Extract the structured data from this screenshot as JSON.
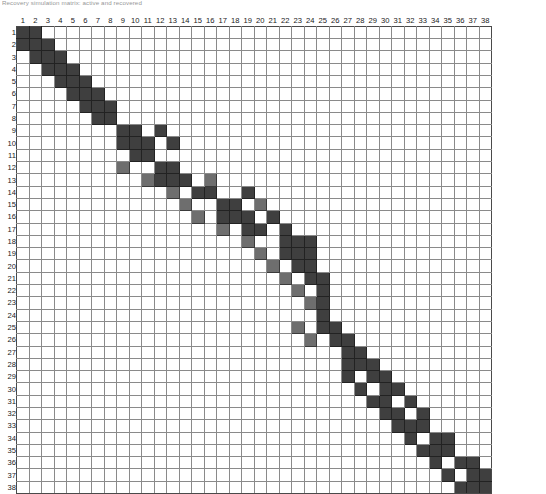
{
  "page": {
    "title": "Recovery simulation matrix: active and recovered",
    "grid_label_axis_top": "column index",
    "grid_label_axis_left": "row index"
  },
  "legend": {
    "on_color": "#3f3f3f",
    "mid_color": "#6e6e6e",
    "off_color": "#ffffff",
    "line_color": "#8a8a8a"
  },
  "chart_data": {
    "type": "heatmap",
    "title": "Recovery simulation matrix: active and recovered",
    "xlabel": "",
    "ylabel": "",
    "grid": true,
    "legend_position": "none",
    "columns": [
      1,
      2,
      3,
      4,
      5,
      6,
      7,
      8,
      9,
      10,
      11,
      12,
      13,
      14,
      15,
      16,
      17,
      18,
      19,
      20,
      21,
      22,
      23,
      24,
      25,
      26,
      27,
      28,
      29,
      30,
      31,
      32,
      33,
      34,
      35,
      36,
      37,
      38
    ],
    "rows": [
      1,
      2,
      3,
      4,
      5,
      6,
      7,
      8,
      9,
      10,
      11,
      12,
      13,
      14,
      15,
      16,
      17,
      18,
      19,
      20,
      21,
      22,
      23,
      24,
      25,
      26,
      27,
      28,
      29,
      30,
      31,
      32,
      33,
      34,
      35,
      36,
      37,
      38
    ],
    "value_levels": {
      "0": "empty",
      "1": "partial",
      "2": "filled"
    },
    "values": [
      [
        2,
        2,
        0,
        0,
        0,
        0,
        0,
        0,
        0,
        0,
        0,
        0,
        0,
        0,
        0,
        0,
        0,
        0,
        0,
        0,
        0,
        0,
        0,
        0,
        0,
        0,
        0,
        0,
        0,
        0,
        0,
        0,
        0,
        0,
        0,
        0,
        0,
        0
      ],
      [
        2,
        2,
        2,
        0,
        0,
        0,
        0,
        0,
        0,
        0,
        0,
        0,
        0,
        0,
        0,
        0,
        0,
        0,
        0,
        0,
        0,
        0,
        0,
        0,
        0,
        0,
        0,
        0,
        0,
        0,
        0,
        0,
        0,
        0,
        0,
        0,
        0,
        0
      ],
      [
        0,
        2,
        2,
        2,
        0,
        0,
        0,
        0,
        0,
        0,
        0,
        0,
        0,
        0,
        0,
        0,
        0,
        0,
        0,
        0,
        0,
        0,
        0,
        0,
        0,
        0,
        0,
        0,
        0,
        0,
        0,
        0,
        0,
        0,
        0,
        0,
        0,
        0
      ],
      [
        0,
        0,
        2,
        2,
        2,
        0,
        0,
        0,
        0,
        0,
        0,
        0,
        0,
        0,
        0,
        0,
        0,
        0,
        0,
        0,
        0,
        0,
        0,
        0,
        0,
        0,
        0,
        0,
        0,
        0,
        0,
        0,
        0,
        0,
        0,
        0,
        0,
        0
      ],
      [
        0,
        0,
        0,
        2,
        2,
        2,
        0,
        0,
        0,
        0,
        0,
        0,
        0,
        0,
        0,
        0,
        0,
        0,
        0,
        0,
        0,
        0,
        0,
        0,
        0,
        0,
        0,
        0,
        0,
        0,
        0,
        0,
        0,
        0,
        0,
        0,
        0,
        0
      ],
      [
        0,
        0,
        0,
        0,
        2,
        2,
        2,
        0,
        0,
        0,
        0,
        0,
        0,
        0,
        0,
        0,
        0,
        0,
        0,
        0,
        0,
        0,
        0,
        0,
        0,
        0,
        0,
        0,
        0,
        0,
        0,
        0,
        0,
        0,
        0,
        0,
        0,
        0
      ],
      [
        0,
        0,
        0,
        0,
        0,
        2,
        2,
        2,
        0,
        0,
        0,
        0,
        0,
        0,
        0,
        0,
        0,
        0,
        0,
        0,
        0,
        0,
        0,
        0,
        0,
        0,
        0,
        0,
        0,
        0,
        0,
        0,
        0,
        0,
        0,
        0,
        0,
        0
      ],
      [
        0,
        0,
        0,
        0,
        0,
        0,
        2,
        2,
        0,
        0,
        0,
        0,
        0,
        0,
        0,
        0,
        0,
        0,
        0,
        0,
        0,
        0,
        0,
        0,
        0,
        0,
        0,
        0,
        0,
        0,
        0,
        0,
        0,
        0,
        0,
        0,
        0,
        0
      ],
      [
        0,
        0,
        0,
        0,
        0,
        0,
        0,
        0,
        2,
        2,
        0,
        2,
        0,
        0,
        0,
        0,
        0,
        0,
        0,
        0,
        0,
        0,
        0,
        0,
        0,
        0,
        0,
        0,
        0,
        0,
        0,
        0,
        0,
        0,
        0,
        0,
        0,
        0
      ],
      [
        0,
        0,
        0,
        0,
        0,
        0,
        0,
        0,
        2,
        2,
        2,
        0,
        2,
        0,
        0,
        0,
        0,
        0,
        0,
        0,
        0,
        0,
        0,
        0,
        0,
        0,
        0,
        0,
        0,
        0,
        0,
        0,
        0,
        0,
        0,
        0,
        0,
        0
      ],
      [
        0,
        0,
        0,
        0,
        0,
        0,
        0,
        0,
        0,
        2,
        2,
        0,
        0,
        0,
        0,
        0,
        0,
        0,
        0,
        0,
        0,
        0,
        0,
        0,
        0,
        0,
        0,
        0,
        0,
        0,
        0,
        0,
        0,
        0,
        0,
        0,
        0,
        0
      ],
      [
        0,
        0,
        0,
        0,
        0,
        0,
        0,
        0,
        1,
        0,
        0,
        2,
        2,
        0,
        0,
        0,
        0,
        0,
        0,
        0,
        0,
        0,
        0,
        0,
        0,
        0,
        0,
        0,
        0,
        0,
        0,
        0,
        0,
        0,
        0,
        0,
        0,
        0
      ],
      [
        0,
        0,
        0,
        0,
        0,
        0,
        0,
        0,
        0,
        0,
        1,
        2,
        2,
        2,
        0,
        1,
        0,
        0,
        0,
        0,
        0,
        0,
        0,
        0,
        0,
        0,
        0,
        0,
        0,
        0,
        0,
        0,
        0,
        0,
        0,
        0,
        0,
        0
      ],
      [
        0,
        0,
        0,
        0,
        0,
        0,
        0,
        0,
        0,
        0,
        0,
        0,
        1,
        0,
        2,
        2,
        0,
        0,
        2,
        0,
        0,
        0,
        0,
        0,
        0,
        0,
        0,
        0,
        0,
        0,
        0,
        0,
        0,
        0,
        0,
        0,
        0,
        0
      ],
      [
        0,
        0,
        0,
        0,
        0,
        0,
        0,
        0,
        0,
        0,
        0,
        0,
        0,
        1,
        0,
        0,
        2,
        2,
        0,
        1,
        0,
        0,
        0,
        0,
        0,
        0,
        0,
        0,
        0,
        0,
        0,
        0,
        0,
        0,
        0,
        0,
        0,
        0
      ],
      [
        0,
        0,
        0,
        0,
        0,
        0,
        0,
        0,
        0,
        0,
        0,
        0,
        0,
        0,
        1,
        0,
        2,
        2,
        2,
        0,
        2,
        0,
        0,
        0,
        0,
        0,
        0,
        0,
        0,
        0,
        0,
        0,
        0,
        0,
        0,
        0,
        0,
        0
      ],
      [
        0,
        0,
        0,
        0,
        0,
        0,
        0,
        0,
        0,
        0,
        0,
        0,
        0,
        0,
        0,
        0,
        1,
        0,
        2,
        2,
        0,
        2,
        0,
        0,
        0,
        0,
        0,
        0,
        0,
        0,
        0,
        0,
        0,
        0,
        0,
        0,
        0,
        0
      ],
      [
        0,
        0,
        0,
        0,
        0,
        0,
        0,
        0,
        0,
        0,
        0,
        0,
        0,
        0,
        0,
        0,
        0,
        0,
        1,
        0,
        0,
        2,
        2,
        2,
        0,
        0,
        0,
        0,
        0,
        0,
        0,
        0,
        0,
        0,
        0,
        0,
        0,
        0
      ],
      [
        0,
        0,
        0,
        0,
        0,
        0,
        0,
        0,
        0,
        0,
        0,
        0,
        0,
        0,
        0,
        0,
        0,
        0,
        0,
        1,
        0,
        2,
        2,
        2,
        0,
        0,
        0,
        0,
        0,
        0,
        0,
        0,
        0,
        0,
        0,
        0,
        0,
        0
      ],
      [
        0,
        0,
        0,
        0,
        0,
        0,
        0,
        0,
        0,
        0,
        0,
        0,
        0,
        0,
        0,
        0,
        0,
        0,
        0,
        0,
        1,
        0,
        2,
        2,
        0,
        0,
        0,
        0,
        0,
        0,
        0,
        0,
        0,
        0,
        0,
        0,
        0,
        0
      ],
      [
        0,
        0,
        0,
        0,
        0,
        0,
        0,
        0,
        0,
        0,
        0,
        0,
        0,
        0,
        0,
        0,
        0,
        0,
        0,
        0,
        0,
        1,
        0,
        2,
        2,
        0,
        0,
        0,
        0,
        0,
        0,
        0,
        0,
        0,
        0,
        0,
        0,
        0
      ],
      [
        0,
        0,
        0,
        0,
        0,
        0,
        0,
        0,
        0,
        0,
        0,
        0,
        0,
        0,
        0,
        0,
        0,
        0,
        0,
        0,
        0,
        0,
        1,
        0,
        2,
        0,
        0,
        0,
        0,
        0,
        0,
        0,
        0,
        0,
        0,
        0,
        0,
        0
      ],
      [
        0,
        0,
        0,
        0,
        0,
        0,
        0,
        0,
        0,
        0,
        0,
        0,
        0,
        0,
        0,
        0,
        0,
        0,
        0,
        0,
        0,
        0,
        0,
        1,
        2,
        0,
        0,
        0,
        0,
        0,
        0,
        0,
        0,
        0,
        0,
        0,
        0,
        0
      ],
      [
        0,
        0,
        0,
        0,
        0,
        0,
        0,
        0,
        0,
        0,
        0,
        0,
        0,
        0,
        0,
        0,
        0,
        0,
        0,
        0,
        0,
        0,
        0,
        0,
        2,
        0,
        0,
        0,
        0,
        0,
        0,
        0,
        0,
        0,
        0,
        0,
        0,
        0
      ],
      [
        0,
        0,
        0,
        0,
        0,
        0,
        0,
        0,
        0,
        0,
        0,
        0,
        0,
        0,
        0,
        0,
        0,
        0,
        0,
        0,
        0,
        0,
        1,
        0,
        2,
        2,
        0,
        0,
        0,
        0,
        0,
        0,
        0,
        0,
        0,
        0,
        0,
        0
      ],
      [
        0,
        0,
        0,
        0,
        0,
        0,
        0,
        0,
        0,
        0,
        0,
        0,
        0,
        0,
        0,
        0,
        0,
        0,
        0,
        0,
        0,
        0,
        0,
        1,
        0,
        2,
        2,
        0,
        0,
        0,
        0,
        0,
        0,
        0,
        0,
        0,
        0,
        0
      ],
      [
        0,
        0,
        0,
        0,
        0,
        0,
        0,
        0,
        0,
        0,
        0,
        0,
        0,
        0,
        0,
        0,
        0,
        0,
        0,
        0,
        0,
        0,
        0,
        0,
        0,
        0,
        2,
        2,
        0,
        0,
        0,
        0,
        0,
        0,
        0,
        0,
        0,
        0
      ],
      [
        0,
        0,
        0,
        0,
        0,
        0,
        0,
        0,
        0,
        0,
        0,
        0,
        0,
        0,
        0,
        0,
        0,
        0,
        0,
        0,
        0,
        0,
        0,
        0,
        0,
        0,
        2,
        2,
        2,
        0,
        0,
        0,
        0,
        0,
        0,
        0,
        0,
        0
      ],
      [
        0,
        0,
        0,
        0,
        0,
        0,
        0,
        0,
        0,
        0,
        0,
        0,
        0,
        0,
        0,
        0,
        0,
        0,
        0,
        0,
        0,
        0,
        0,
        0,
        0,
        0,
        2,
        0,
        2,
        2,
        0,
        0,
        0,
        0,
        0,
        0,
        0,
        0
      ],
      [
        0,
        0,
        0,
        0,
        0,
        0,
        0,
        0,
        0,
        0,
        0,
        0,
        0,
        0,
        0,
        0,
        0,
        0,
        0,
        0,
        0,
        0,
        0,
        0,
        0,
        0,
        0,
        2,
        0,
        2,
        2,
        0,
        0,
        0,
        0,
        0,
        0,
        0
      ],
      [
        0,
        0,
        0,
        0,
        0,
        0,
        0,
        0,
        0,
        0,
        0,
        0,
        0,
        0,
        0,
        0,
        0,
        0,
        0,
        0,
        0,
        0,
        0,
        0,
        0,
        0,
        0,
        0,
        2,
        2,
        0,
        2,
        0,
        0,
        0,
        0,
        0,
        0
      ],
      [
        0,
        0,
        0,
        0,
        0,
        0,
        0,
        0,
        0,
        0,
        0,
        0,
        0,
        0,
        0,
        0,
        0,
        0,
        0,
        0,
        0,
        0,
        0,
        0,
        0,
        0,
        0,
        0,
        0,
        2,
        2,
        0,
        2,
        0,
        0,
        0,
        0,
        0
      ],
      [
        0,
        0,
        0,
        0,
        0,
        0,
        0,
        0,
        0,
        0,
        0,
        0,
        0,
        0,
        0,
        0,
        0,
        0,
        0,
        0,
        0,
        0,
        0,
        0,
        0,
        0,
        0,
        0,
        0,
        0,
        2,
        2,
        2,
        0,
        0,
        0,
        0,
        0
      ],
      [
        0,
        0,
        0,
        0,
        0,
        0,
        0,
        0,
        0,
        0,
        0,
        0,
        0,
        0,
        0,
        0,
        0,
        0,
        0,
        0,
        0,
        0,
        0,
        0,
        0,
        0,
        0,
        0,
        0,
        0,
        0,
        2,
        0,
        2,
        2,
        0,
        0,
        0
      ],
      [
        0,
        0,
        0,
        0,
        0,
        0,
        0,
        0,
        0,
        0,
        0,
        0,
        0,
        0,
        0,
        0,
        0,
        0,
        0,
        0,
        0,
        0,
        0,
        0,
        0,
        0,
        0,
        0,
        0,
        0,
        0,
        0,
        2,
        2,
        2,
        0,
        0,
        0
      ],
      [
        0,
        0,
        0,
        0,
        0,
        0,
        0,
        0,
        0,
        0,
        0,
        0,
        0,
        0,
        0,
        0,
        0,
        0,
        0,
        0,
        0,
        0,
        0,
        0,
        0,
        0,
        0,
        0,
        0,
        0,
        0,
        0,
        0,
        2,
        0,
        2,
        2,
        0
      ],
      [
        0,
        0,
        0,
        0,
        0,
        0,
        0,
        0,
        0,
        0,
        0,
        0,
        0,
        0,
        0,
        0,
        0,
        0,
        0,
        0,
        0,
        0,
        0,
        0,
        0,
        0,
        0,
        0,
        0,
        0,
        0,
        0,
        0,
        0,
        2,
        0,
        2,
        2
      ],
      [
        0,
        0,
        0,
        0,
        0,
        0,
        0,
        0,
        0,
        0,
        0,
        0,
        0,
        0,
        0,
        0,
        0,
        0,
        0,
        0,
        0,
        0,
        0,
        0,
        0,
        0,
        0,
        0,
        0,
        0,
        0,
        0,
        0,
        0,
        0,
        2,
        2,
        2
      ]
    ]
  }
}
